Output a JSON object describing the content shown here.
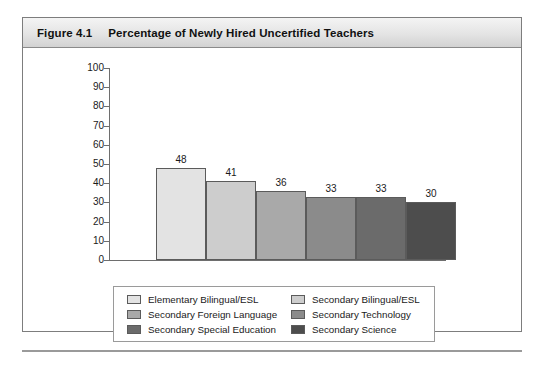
{
  "figure": {
    "number": "Figure 4.1",
    "title": "Percentage of Newly Hired Uncertified Teachers"
  },
  "chart_data": {
    "type": "bar",
    "title": "Percentage of Newly Hired Uncertified Teachers",
    "xlabel": "Subject Area",
    "ylabel": "",
    "ylim": [
      0,
      100
    ],
    "ytick_step": 10,
    "ytick_labels": [
      "100",
      "90",
      "80",
      "70",
      "60",
      "50",
      "40",
      "30",
      "20",
      "10",
      "0"
    ],
    "grid": false,
    "legend_position": "bottom",
    "categories": [
      "Elementary Bilingual/ESL",
      "Secondary Bilingual/ESL",
      "Secondary Foreign Language",
      "Secondary Technology",
      "Secondary Special Education",
      "Secondary Science"
    ],
    "values": [
      48,
      41,
      36,
      33,
      33,
      30
    ],
    "data_labels": [
      "48",
      "41",
      "36",
      "33",
      "33",
      "30"
    ],
    "colors": [
      "#e3e3e3",
      "#cdcdcd",
      "#a9a9a9",
      "#8b8b8b",
      "#6b6b6b",
      "#4d4d4d"
    ]
  },
  "legend": {
    "rows": [
      {
        "left": {
          "label": "Elementary Bilingual/ESL",
          "color": "#e3e3e3"
        },
        "right": {
          "label": "Secondary Bilingual/ESL",
          "color": "#cdcdcd"
        }
      },
      {
        "left": {
          "label": "Secondary Foreign Language",
          "color": "#a9a9a9"
        },
        "right": {
          "label": "Secondary Technology",
          "color": "#8b8b8b"
        }
      },
      {
        "left": {
          "label": "Secondary Special Education",
          "color": "#6b6b6b"
        },
        "right": {
          "label": "Secondary Science",
          "color": "#4d4d4d"
        }
      }
    ]
  }
}
